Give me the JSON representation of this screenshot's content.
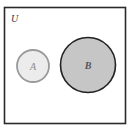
{
  "diagram": {
    "type": "venn",
    "universe": {
      "label": "U",
      "border_color": "#2a2a2a",
      "fill": "#ffffff"
    },
    "sets": [
      {
        "label": "A",
        "fill": "#ececec",
        "border_color": "#9a9a9a",
        "relation": "disjoint"
      },
      {
        "label": "B",
        "fill": "#c6c6c6",
        "border_color": "#222222",
        "relation": "disjoint",
        "shaded": true
      }
    ]
  }
}
